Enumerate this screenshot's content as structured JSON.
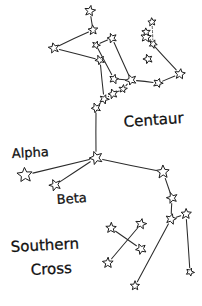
{
  "canvas": {
    "width": 202,
    "height": 306,
    "background": "#ffffff"
  },
  "style": {
    "ink": "#1c1c1c",
    "line": "#2b2b2b",
    "star_fill": "#ffffff"
  },
  "labels": [
    {
      "id": "centaur",
      "text": "Centaur",
      "x": 124,
      "y": 127,
      "size": 15,
      "rotate": -4
    },
    {
      "id": "alpha",
      "text": "Alpha",
      "x": 12,
      "y": 158,
      "size": 13,
      "rotate": -3
    },
    {
      "id": "beta",
      "text": "Beta",
      "x": 57,
      "y": 204,
      "size": 13,
      "rotate": -4
    },
    {
      "id": "southern",
      "text": "Southern",
      "x": 11,
      "y": 252,
      "size": 15,
      "rotate": -3
    },
    {
      "id": "cross",
      "text": "Cross",
      "x": 31,
      "y": 275,
      "size": 15,
      "rotate": -3
    }
  ],
  "chart_data": {
    "type": "scatter",
    "xlabel": "",
    "ylabel": "",
    "xlim": [
      0,
      202
    ],
    "ylim": [
      0,
      306
    ],
    "grid": false,
    "legend": "none",
    "annotations": [
      "Centaur",
      "Alpha",
      "Beta",
      "Southern",
      "Cross"
    ],
    "groups": [
      {
        "name": "Centaurus upper limb (left arm)",
        "point_ids": [
          "u1",
          "u2",
          "u3",
          "u4"
        ]
      },
      {
        "name": "Centaurus body and right shoulder",
        "point_ids": [
          "b1",
          "b2",
          "b3",
          "b4",
          "b5",
          "b6",
          "b7",
          "b8"
        ]
      },
      {
        "name": "Centaurus spine to Alpha/Beta junction",
        "point_ids": [
          "s1",
          "s2",
          "s3",
          "s4",
          "j1"
        ]
      },
      {
        "name": "Alpha and Beta Centauri",
        "point_ids": [
          "alpha",
          "beta",
          "j1",
          "r1"
        ]
      },
      {
        "name": "Right leg chain",
        "point_ids": [
          "r1",
          "r2",
          "r3",
          "r4",
          "r5",
          "r6"
        ]
      },
      {
        "name": "Top right small cluster",
        "point_ids": [
          "t1",
          "t2",
          "t3",
          "t4"
        ]
      },
      {
        "name": "Southern Cross",
        "point_ids": [
          "c1",
          "c2",
          "c3",
          "c4"
        ]
      }
    ],
    "points": [
      {
        "id": "u1",
        "label": "",
        "x": 90,
        "y": 11,
        "size": 9
      },
      {
        "id": "u2",
        "label": "",
        "x": 93,
        "y": 30,
        "size": 8
      },
      {
        "id": "u3",
        "label": "",
        "x": 54,
        "y": 48,
        "size": 9
      },
      {
        "id": "u4",
        "label": "",
        "x": 100,
        "y": 60,
        "size": 8
      },
      {
        "id": "b1",
        "label": "",
        "x": 146,
        "y": 37,
        "size": 9
      },
      {
        "id": "b2",
        "label": "",
        "x": 148,
        "y": 59,
        "size": 8
      },
      {
        "id": "b3",
        "label": "",
        "x": 180,
        "y": 74,
        "size": 9
      },
      {
        "id": "b4",
        "label": "",
        "x": 158,
        "y": 83,
        "size": 8
      },
      {
        "id": "b5",
        "label": "",
        "x": 131,
        "y": 80,
        "size": 9
      },
      {
        "id": "b6",
        "label": "",
        "x": 114,
        "y": 79,
        "size": 8
      },
      {
        "id": "b7",
        "label": "",
        "x": 112,
        "y": 38,
        "size": 8
      },
      {
        "id": "b8",
        "label": "",
        "x": 96,
        "y": 45,
        "size": 7
      },
      {
        "id": "s1",
        "label": "",
        "x": 123,
        "y": 89,
        "size": 7
      },
      {
        "id": "s2",
        "label": "",
        "x": 113,
        "y": 94,
        "size": 8
      },
      {
        "id": "s3",
        "label": "",
        "x": 104,
        "y": 99,
        "size": 8
      },
      {
        "id": "s4",
        "label": "",
        "x": 96,
        "y": 108,
        "size": 8
      },
      {
        "id": "j1",
        "label": "",
        "x": 96,
        "y": 158,
        "size": 11
      },
      {
        "id": "alpha",
        "label": "Alpha",
        "x": 25,
        "y": 175,
        "size": 13
      },
      {
        "id": "beta",
        "label": "Beta",
        "x": 55,
        "y": 185,
        "size": 10
      },
      {
        "id": "r1",
        "label": "",
        "x": 163,
        "y": 172,
        "size": 11
      },
      {
        "id": "r2",
        "label": "",
        "x": 172,
        "y": 198,
        "size": 9
      },
      {
        "id": "r3",
        "label": "",
        "x": 171,
        "y": 219,
        "size": 9
      },
      {
        "id": "r4",
        "label": "",
        "x": 186,
        "y": 214,
        "size": 9
      },
      {
        "id": "r5",
        "label": "",
        "x": 135,
        "y": 286,
        "size": 8
      },
      {
        "id": "r6",
        "label": "",
        "x": 190,
        "y": 272,
        "size": 7
      },
      {
        "id": "t1",
        "label": "",
        "x": 152,
        "y": 22,
        "size": 7
      },
      {
        "id": "t2",
        "label": "",
        "x": 146,
        "y": 32,
        "size": 7
      },
      {
        "id": "t3",
        "label": "",
        "x": 153,
        "y": 44,
        "size": 7
      },
      {
        "id": "c1",
        "label": "",
        "x": 111,
        "y": 228,
        "size": 9
      },
      {
        "id": "c2",
        "label": "",
        "x": 141,
        "y": 224,
        "size": 9
      },
      {
        "id": "c3",
        "label": "",
        "x": 141,
        "y": 249,
        "size": 9
      },
      {
        "id": "c4",
        "label": "",
        "x": 108,
        "y": 263,
        "size": 9
      }
    ],
    "edges": [
      {
        "from": "u1",
        "to": "u2",
        "style": "solid"
      },
      {
        "from": "u2",
        "to": "u3",
        "style": "solid"
      },
      {
        "from": "u3",
        "to": "u4",
        "style": "solid"
      },
      {
        "from": "u4",
        "to": "s3",
        "style": "solid"
      },
      {
        "from": "b7",
        "to": "b8",
        "style": "solid"
      },
      {
        "from": "b8",
        "to": "b6",
        "style": "solid"
      },
      {
        "from": "b7",
        "to": "b5",
        "style": "solid"
      },
      {
        "from": "b5",
        "to": "b6",
        "style": "solid"
      },
      {
        "from": "b5",
        "to": "b4",
        "style": "solid"
      },
      {
        "from": "b4",
        "to": "b3",
        "style": "solid"
      },
      {
        "from": "b3",
        "to": "b1",
        "style": "solid"
      },
      {
        "from": "b1",
        "to": "t3",
        "style": "solid"
      },
      {
        "from": "t1",
        "to": "t3",
        "style": "dash"
      },
      {
        "from": "t2",
        "to": "t3",
        "style": "dash"
      },
      {
        "from": "b5",
        "to": "s1",
        "style": "solid"
      },
      {
        "from": "s1",
        "to": "s2",
        "style": "solid"
      },
      {
        "from": "s2",
        "to": "s3",
        "style": "solid"
      },
      {
        "from": "s3",
        "to": "s4",
        "style": "solid"
      },
      {
        "from": "s4",
        "to": "j1",
        "style": "solid"
      },
      {
        "from": "j1",
        "to": "alpha",
        "style": "solid"
      },
      {
        "from": "j1",
        "to": "beta",
        "style": "solid"
      },
      {
        "from": "j1",
        "to": "r1",
        "style": "solid"
      },
      {
        "from": "r1",
        "to": "r2",
        "style": "solid"
      },
      {
        "from": "r2",
        "to": "r3",
        "style": "solid"
      },
      {
        "from": "r3",
        "to": "r4",
        "style": "solid"
      },
      {
        "from": "r3",
        "to": "r5",
        "style": "solid"
      },
      {
        "from": "r4",
        "to": "r6",
        "style": "solid"
      },
      {
        "from": "c1",
        "to": "c3",
        "style": "solid"
      },
      {
        "from": "c2",
        "to": "c4",
        "style": "solid"
      }
    ]
  }
}
